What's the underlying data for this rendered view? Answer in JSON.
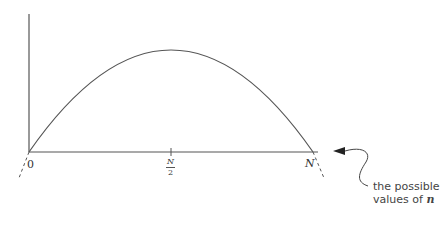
{
  "diagram": {
    "type": "parabola-plot",
    "x_axis": {
      "ticks": [
        {
          "label": "0"
        },
        {
          "label_num": "N",
          "label_den": "2"
        },
        {
          "label": "N"
        }
      ]
    },
    "annotation": {
      "line1": "the possible",
      "line2_prefix": "values of ",
      "line2_var": "n"
    },
    "colors": {
      "stroke": "#555555",
      "text": "#333333"
    }
  }
}
